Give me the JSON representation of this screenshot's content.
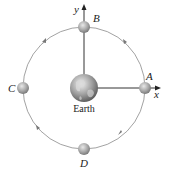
{
  "diagram": {
    "center_label": "Earth",
    "axes": {
      "x_label": "x",
      "y_label": "y"
    },
    "points": [
      {
        "id": "A",
        "label": "A",
        "position": "right"
      },
      {
        "id": "B",
        "label": "B",
        "position": "top"
      },
      {
        "id": "C",
        "label": "C",
        "position": "left"
      },
      {
        "id": "D",
        "label": "D",
        "position": "bottom"
      }
    ],
    "orbit_direction": "counterclockwise",
    "colors": {
      "orbit": "#8a8a8a",
      "axis": "#333333",
      "satellite": "#a8a8a8",
      "earth": "#9a9a9a"
    }
  }
}
